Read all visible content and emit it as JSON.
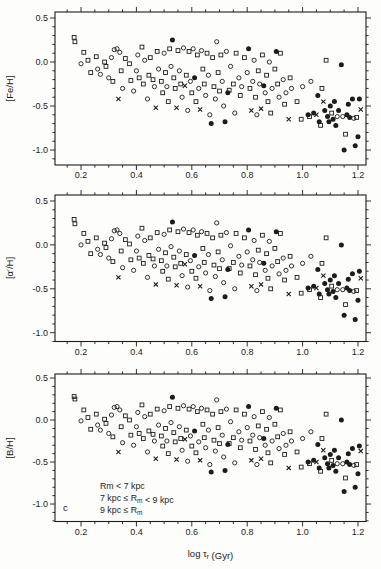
{
  "chart_data": {
    "type": "scatter",
    "title": "",
    "xlabel": "log τr (Gyr)",
    "xlabel_segments": [
      {
        "t": "log τ"
      },
      {
        "t": "r",
        "sub": true
      },
      {
        "t": " (Gyr)"
      }
    ],
    "xlim": [
      0.106,
      1.229
    ],
    "xticks": [
      0.2,
      0.4,
      0.6,
      0.8,
      1.0,
      1.2
    ],
    "xtick_labels": [
      "0.2",
      "0.4",
      "0.6",
      "0.8",
      "1.0",
      "1.2"
    ],
    "x_minor_step": 0.05,
    "yticks": [
      0.5,
      0.0,
      -0.5,
      -1.0
    ],
    "ytick_labels": [
      "0.5",
      "0.0",
      "-0.5",
      "-1.0"
    ],
    "y_minor_step": 0.1,
    "grid": false,
    "markers": {
      "o": "open-circle",
      "s": "open-square",
      "x": "cross",
      "f": "filled-circle"
    },
    "ink": "#1c1c1c",
    "background": "#fdfdfb",
    "panels": [
      {
        "ylabel": "[Fe/H]",
        "ylim": [
          -1.17,
          0.568
        ],
        "series_key": "fe"
      },
      {
        "ylabel": "[α′/H]",
        "ylim": [
          -1.1,
          0.568
        ],
        "series_key": "alpha"
      },
      {
        "ylabel": "[B/H]",
        "ylim": [
          -1.208,
          0.548
        ],
        "series_key": "b",
        "panel_letter": "c"
      }
    ],
    "legend_position": "bottom-left-of-third-panel",
    "legend_lines_plain": [
      "Rm < 7 kpc",
      "7 kpc ≤ Rm < 9 kpc",
      "9 kpc ≤ Rm"
    ],
    "legend_lines": [
      [
        {
          "t": "Rm < 7 kpc"
        }
      ],
      [
        {
          "t": "7 kpc ≤ R"
        },
        {
          "t": "m",
          "sub": true
        },
        {
          "t": " < 9 kpc"
        }
      ],
      [
        {
          "t": "9 kpc ≤ R"
        },
        {
          "t": "m",
          "sub": true
        }
      ]
    ],
    "stars_format": [
      "x_log_age",
      "y_FeH",
      "y_alphaH",
      "y_BH",
      "marker"
    ],
    "stars": [
      [
        0.175,
        0.28,
        0.29,
        0.28,
        "s"
      ],
      [
        0.178,
        0.23,
        0.24,
        0.25,
        "s"
      ],
      [
        0.21,
        0.11,
        0.13,
        0.12,
        "s"
      ],
      [
        0.2,
        -0.02,
        0.0,
        -0.01,
        "o"
      ],
      [
        0.225,
        0.02,
        0.04,
        0.03,
        "s"
      ],
      [
        0.235,
        -0.12,
        -0.1,
        -0.11,
        "s"
      ],
      [
        0.255,
        0.06,
        0.08,
        0.07,
        "s"
      ],
      [
        0.26,
        -0.08,
        -0.05,
        -0.06,
        "o"
      ],
      [
        0.27,
        -0.14,
        -0.11,
        -0.12,
        "o"
      ],
      [
        0.285,
        0.0,
        0.02,
        0.01,
        "s"
      ],
      [
        0.29,
        -0.05,
        -0.03,
        -0.04,
        "s"
      ],
      [
        0.3,
        -0.18,
        -0.15,
        -0.16,
        "o"
      ],
      [
        0.31,
        0.05,
        0.07,
        0.06,
        "o"
      ],
      [
        0.315,
        -0.22,
        -0.19,
        -0.2,
        "s"
      ],
      [
        0.32,
        0.14,
        0.16,
        0.15,
        "o"
      ],
      [
        0.33,
        0.15,
        0.17,
        0.16,
        "o"
      ],
      [
        0.335,
        -0.42,
        -0.37,
        -0.38,
        "x"
      ],
      [
        0.34,
        0.11,
        0.13,
        0.12,
        "o"
      ],
      [
        0.345,
        -0.1,
        -0.07,
        -0.08,
        "s"
      ],
      [
        0.35,
        -0.3,
        -0.26,
        -0.27,
        "o"
      ],
      [
        0.36,
        0.04,
        0.06,
        0.05,
        "s"
      ],
      [
        0.375,
        -0.02,
        0.01,
        0.0,
        "s"
      ],
      [
        0.38,
        -0.21,
        -0.17,
        -0.18,
        "s"
      ],
      [
        0.39,
        -0.33,
        -0.29,
        -0.3,
        "o"
      ],
      [
        0.4,
        -0.1,
        -0.07,
        -0.08,
        "o"
      ],
      [
        0.405,
        0.08,
        0.1,
        0.09,
        "o"
      ],
      [
        0.41,
        -0.18,
        -0.15,
        -0.16,
        "s"
      ],
      [
        0.42,
        0.17,
        0.19,
        0.18,
        "s"
      ],
      [
        0.425,
        -0.25,
        -0.21,
        -0.22,
        "s"
      ],
      [
        0.43,
        0.02,
        0.05,
        0.04,
        "o"
      ],
      [
        0.44,
        -0.42,
        -0.37,
        -0.38,
        "o"
      ],
      [
        0.445,
        -0.15,
        -0.12,
        -0.13,
        "s"
      ],
      [
        0.45,
        0.05,
        0.08,
        0.07,
        "s"
      ],
      [
        0.46,
        -0.2,
        -0.16,
        -0.17,
        "s"
      ],
      [
        0.465,
        -0.28,
        -0.24,
        -0.25,
        "o"
      ],
      [
        0.47,
        -0.52,
        -0.45,
        -0.46,
        "x"
      ],
      [
        0.475,
        0.12,
        0.14,
        0.13,
        "s"
      ],
      [
        0.48,
        -0.08,
        -0.05,
        -0.06,
        "o"
      ],
      [
        0.49,
        -0.22,
        -0.18,
        -0.19,
        "s"
      ],
      [
        0.495,
        -0.35,
        -0.3,
        -0.31,
        "s"
      ],
      [
        0.5,
        0.1,
        0.12,
        0.11,
        "o"
      ],
      [
        0.505,
        -0.12,
        -0.09,
        -0.1,
        "s"
      ],
      [
        0.51,
        -0.28,
        -0.24,
        -0.25,
        "o"
      ],
      [
        0.515,
        -0.45,
        -0.39,
        -0.4,
        "s"
      ],
      [
        0.52,
        0.15,
        0.17,
        0.16,
        "s"
      ],
      [
        0.525,
        -0.05,
        -0.02,
        -0.03,
        "o"
      ],
      [
        0.53,
        0.25,
        0.26,
        0.27,
        "f"
      ],
      [
        0.535,
        -0.18,
        -0.14,
        -0.15,
        "s"
      ],
      [
        0.54,
        -0.3,
        -0.25,
        -0.26,
        "s"
      ],
      [
        0.545,
        -0.52,
        -0.46,
        -0.47,
        "x"
      ],
      [
        0.55,
        0.13,
        0.15,
        0.14,
        "s"
      ],
      [
        0.555,
        -0.1,
        -0.07,
        -0.08,
        "o"
      ],
      [
        0.56,
        -0.25,
        -0.21,
        -0.22,
        "s"
      ],
      [
        0.565,
        -0.4,
        -0.35,
        -0.36,
        "o"
      ],
      [
        0.57,
        0.16,
        0.18,
        0.17,
        "o"
      ],
      [
        0.575,
        -0.27,
        -0.22,
        -0.23,
        "x"
      ],
      [
        0.58,
        -0.15,
        -0.11,
        -0.12,
        "s"
      ],
      [
        0.585,
        -0.55,
        -0.48,
        -0.49,
        "o"
      ],
      [
        0.59,
        0.12,
        0.14,
        0.13,
        "s"
      ],
      [
        0.595,
        -0.22,
        -0.18,
        -0.19,
        "o"
      ],
      [
        0.6,
        -0.35,
        -0.3,
        -0.31,
        "s"
      ],
      [
        0.605,
        0.15,
        0.17,
        0.16,
        "o"
      ],
      [
        0.61,
        -0.18,
        -0.12,
        -0.13,
        "f"
      ],
      [
        0.615,
        -0.45,
        -0.38,
        -0.39,
        "s"
      ],
      [
        0.62,
        0.08,
        0.11,
        0.1,
        "s"
      ],
      [
        0.625,
        -0.3,
        -0.25,
        -0.26,
        "o"
      ],
      [
        0.63,
        -0.54,
        -0.47,
        -0.48,
        "x"
      ],
      [
        0.635,
        0.13,
        0.15,
        0.14,
        "o"
      ],
      [
        0.64,
        -0.08,
        -0.04,
        -0.05,
        "s"
      ],
      [
        0.645,
        -0.25,
        -0.2,
        -0.21,
        "s"
      ],
      [
        0.65,
        -0.38,
        -0.32,
        -0.33,
        "o"
      ],
      [
        0.655,
        0.1,
        0.13,
        0.12,
        "s"
      ],
      [
        0.66,
        -0.15,
        -0.11,
        -0.12,
        "o"
      ],
      [
        0.665,
        -0.6,
        -0.52,
        -0.53,
        "o"
      ],
      [
        0.67,
        -0.7,
        -0.61,
        -0.62,
        "f"
      ],
      [
        0.675,
        0.05,
        0.08,
        0.07,
        "s"
      ],
      [
        0.68,
        -0.28,
        -0.23,
        -0.24,
        "s"
      ],
      [
        0.685,
        -0.42,
        -0.36,
        -0.37,
        "o"
      ],
      [
        0.69,
        0.23,
        0.25,
        0.24,
        "o"
      ],
      [
        0.695,
        -0.12,
        -0.08,
        -0.09,
        "s"
      ],
      [
        0.7,
        -0.33,
        -0.27,
        -0.28,
        "s"
      ],
      [
        0.705,
        0.08,
        0.11,
        0.1,
        "s"
      ],
      [
        0.71,
        -0.22,
        -0.17,
        -0.18,
        "o"
      ],
      [
        0.715,
        -0.5,
        -0.43,
        -0.44,
        "o"
      ],
      [
        0.72,
        -0.68,
        -0.59,
        -0.6,
        "f"
      ],
      [
        0.725,
        0.12,
        0.14,
        0.13,
        "o"
      ],
      [
        0.73,
        -0.35,
        -0.28,
        -0.29,
        "f"
      ],
      [
        0.735,
        -0.32,
        -0.27,
        -0.28,
        "s"
      ],
      [
        0.74,
        -0.05,
        -0.01,
        -0.02,
        "o"
      ],
      [
        0.75,
        -0.25,
        -0.2,
        -0.21,
        "s"
      ],
      [
        0.755,
        -0.58,
        -0.5,
        -0.51,
        "o"
      ],
      [
        0.76,
        0.1,
        0.13,
        0.12,
        "s"
      ],
      [
        0.77,
        -0.18,
        -0.13,
        -0.14,
        "o"
      ],
      [
        0.775,
        -0.38,
        -0.32,
        -0.33,
        "s"
      ],
      [
        0.78,
        -0.28,
        -0.23,
        -0.24,
        "o"
      ],
      [
        0.79,
        0.05,
        0.08,
        0.07,
        "s"
      ],
      [
        0.8,
        -0.12,
        -0.08,
        -0.09,
        "o"
      ],
      [
        0.805,
        0.15,
        0.17,
        0.16,
        "f"
      ],
      [
        0.81,
        -0.3,
        -0.24,
        -0.25,
        "s"
      ],
      [
        0.815,
        -0.55,
        -0.47,
        -0.48,
        "x"
      ],
      [
        0.82,
        -0.22,
        -0.17,
        -0.18,
        "o"
      ],
      [
        0.825,
        0.02,
        0.05,
        0.04,
        "o"
      ],
      [
        0.83,
        -0.4,
        -0.34,
        -0.35,
        "s"
      ],
      [
        0.835,
        -0.6,
        -0.52,
        -0.53,
        "o"
      ],
      [
        0.84,
        -0.1,
        -0.06,
        -0.07,
        "s"
      ],
      [
        0.845,
        -0.25,
        -0.2,
        -0.21,
        "o"
      ],
      [
        0.85,
        -0.53,
        -0.45,
        -0.46,
        "x"
      ],
      [
        0.855,
        0.08,
        0.11,
        0.1,
        "s"
      ],
      [
        0.86,
        -0.27,
        -0.21,
        -0.22,
        "f"
      ],
      [
        0.865,
        -0.35,
        -0.29,
        -0.3,
        "o"
      ],
      [
        0.87,
        -0.15,
        -0.1,
        -0.11,
        "s"
      ],
      [
        0.875,
        -0.45,
        -0.38,
        -0.39,
        "s"
      ],
      [
        0.88,
        0.0,
        0.04,
        0.03,
        "o"
      ],
      [
        0.885,
        -0.58,
        -0.5,
        -0.51,
        "s"
      ],
      [
        0.89,
        -0.3,
        -0.24,
        -0.25,
        "o"
      ],
      [
        0.9,
        -0.08,
        -0.04,
        -0.05,
        "s"
      ],
      [
        0.905,
        0.12,
        0.15,
        0.14,
        "f"
      ],
      [
        0.91,
        -0.25,
        -0.19,
        -0.2,
        "s"
      ],
      [
        0.915,
        -0.4,
        -0.33,
        -0.34,
        "o"
      ],
      [
        0.92,
        0.1,
        0.13,
        0.12,
        "s"
      ],
      [
        0.93,
        -0.2,
        -0.15,
        -0.16,
        "o"
      ],
      [
        0.935,
        -0.48,
        -0.4,
        -0.41,
        "s"
      ],
      [
        0.94,
        -0.35,
        -0.29,
        -0.3,
        "o"
      ],
      [
        0.95,
        -0.65,
        -0.56,
        -0.57,
        "x"
      ],
      [
        0.955,
        -0.18,
        -0.13,
        -0.14,
        "s"
      ],
      [
        0.96,
        -0.3,
        -0.24,
        -0.25,
        "o"
      ],
      [
        0.98,
        -0.45,
        -0.37,
        -0.38,
        "s"
      ],
      [
        0.995,
        -0.65,
        -0.55,
        -0.56,
        "s"
      ],
      [
        1.0,
        -0.28,
        -0.21,
        -0.22,
        "o"
      ],
      [
        1.02,
        -0.6,
        -0.49,
        -0.5,
        "f"
      ],
      [
        1.025,
        -0.62,
        -0.51,
        -0.52,
        "s"
      ],
      [
        1.03,
        -0.22,
        -0.13,
        -0.14,
        "o"
      ],
      [
        1.04,
        -0.58,
        -0.47,
        -0.48,
        "f"
      ],
      [
        1.05,
        -0.6,
        -0.49,
        -0.5,
        "x"
      ],
      [
        1.055,
        -0.38,
        -0.28,
        -0.29,
        "f"
      ],
      [
        1.06,
        -0.68,
        -0.56,
        -0.57,
        "f"
      ],
      [
        1.065,
        -0.72,
        -0.6,
        -0.61,
        "s"
      ],
      [
        1.07,
        -0.3,
        -0.21,
        -0.22,
        "s"
      ],
      [
        1.075,
        -0.45,
        -0.35,
        -0.36,
        "x"
      ],
      [
        1.08,
        -0.55,
        -0.44,
        -0.45,
        "f"
      ],
      [
        1.085,
        0.02,
        0.08,
        0.07,
        "s"
      ],
      [
        1.09,
        -0.62,
        -0.51,
        -0.52,
        "f"
      ],
      [
        1.095,
        -0.68,
        -0.56,
        -0.57,
        "f"
      ],
      [
        1.1,
        -0.5,
        -0.4,
        -0.41,
        "f"
      ],
      [
        1.105,
        -0.58,
        -0.47,
        -0.48,
        "s"
      ],
      [
        1.11,
        -0.65,
        -0.53,
        -0.54,
        "f"
      ],
      [
        1.115,
        -0.45,
        -0.35,
        -0.36,
        "f"
      ],
      [
        1.12,
        -0.72,
        -0.6,
        -0.61,
        "f"
      ],
      [
        1.125,
        -0.62,
        -0.51,
        -0.52,
        "o"
      ],
      [
        1.13,
        -0.55,
        -0.44,
        -0.45,
        "f"
      ],
      [
        1.14,
        -0.03,
        0.0,
        0.0,
        "f"
      ],
      [
        1.145,
        -0.62,
        -0.51,
        -0.52,
        "o"
      ],
      [
        1.15,
        -1.0,
        -0.8,
        -0.85,
        "f"
      ],
      [
        1.155,
        -0.82,
        -0.68,
        -0.69,
        "s"
      ],
      [
        1.16,
        -0.6,
        -0.49,
        -0.5,
        "f"
      ],
      [
        1.165,
        -0.48,
        -0.39,
        -0.4,
        "f"
      ],
      [
        1.17,
        -0.63,
        -0.52,
        -0.53,
        "f"
      ],
      [
        1.18,
        -0.42,
        -0.33,
        -0.34,
        "f"
      ],
      [
        1.185,
        -0.64,
        -0.53,
        -0.54,
        "o"
      ],
      [
        1.19,
        -0.95,
        -0.85,
        -0.8,
        "f"
      ],
      [
        1.195,
        -0.63,
        -0.52,
        -0.53,
        "s"
      ],
      [
        1.2,
        -0.85,
        -0.63,
        -0.64,
        "f"
      ],
      [
        1.205,
        -0.42,
        -0.3,
        -0.31,
        "f"
      ],
      [
        1.21,
        -0.54,
        -0.38,
        -0.37,
        "x"
      ]
    ]
  }
}
